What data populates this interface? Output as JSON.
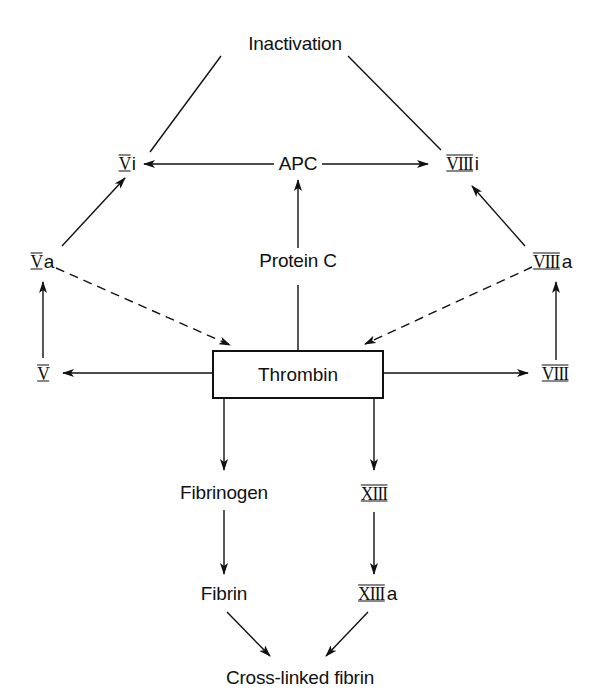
{
  "diagram": {
    "type": "flowchart",
    "nodes": {
      "inactivation": "Inactivation",
      "vi": {
        "numeral": "V",
        "suffix": "i"
      },
      "apc": "APC",
      "viiii": {
        "numeral": "VIII",
        "suffix": "i"
      },
      "va": {
        "numeral": "V",
        "suffix": "a"
      },
      "protein_c": "Protein C",
      "viiia": {
        "numeral": "VIII",
        "suffix": "a"
      },
      "v": {
        "numeral": "V",
        "suffix": ""
      },
      "thrombin": "Thrombin",
      "viii": {
        "numeral": "VIII",
        "suffix": ""
      },
      "fibrinogen": "Fibrinogen",
      "xiii": {
        "numeral": "XIII",
        "suffix": ""
      },
      "fibrin": "Fibrin",
      "xiiia": {
        "numeral": "XIII",
        "suffix": "a"
      },
      "crosslinked": "Cross-linked fibrin"
    },
    "edges": [
      {
        "from": "Vi",
        "to": "Inactivation",
        "style": "line"
      },
      {
        "from": "VIIIi",
        "to": "Inactivation",
        "style": "line"
      },
      {
        "from": "APC",
        "to": "Vi",
        "style": "arrow"
      },
      {
        "from": "APC",
        "to": "VIIIi",
        "style": "arrow"
      },
      {
        "from": "Protein C",
        "to": "APC",
        "style": "arrow"
      },
      {
        "from": "Va",
        "to": "Vi",
        "style": "arrow"
      },
      {
        "from": "VIIIa",
        "to": "VIIIi",
        "style": "arrow"
      },
      {
        "from": "Va",
        "to": "Thrombin",
        "style": "dashed-arrow"
      },
      {
        "from": "VIIIa",
        "to": "Thrombin",
        "style": "dashed-arrow"
      },
      {
        "from": "Thrombin",
        "to": "Protein C",
        "style": "arrow"
      },
      {
        "from": "Thrombin",
        "to": "V",
        "style": "arrow"
      },
      {
        "from": "Thrombin",
        "to": "VIII",
        "style": "arrow"
      },
      {
        "from": "V",
        "to": "Va",
        "style": "arrow"
      },
      {
        "from": "VIII",
        "to": "VIIIa",
        "style": "arrow"
      },
      {
        "from": "Thrombin",
        "to": "Fibrinogen",
        "style": "arrow"
      },
      {
        "from": "Thrombin",
        "to": "XIII",
        "style": "arrow"
      },
      {
        "from": "Fibrinogen",
        "to": "Fibrin",
        "style": "arrow"
      },
      {
        "from": "XIII",
        "to": "XIIIa",
        "style": "arrow"
      },
      {
        "from": "Fibrin",
        "to": "Cross-linked fibrin",
        "style": "arrow"
      },
      {
        "from": "XIIIa",
        "to": "Cross-linked fibrin",
        "style": "arrow"
      }
    ],
    "colors": {
      "ink": "#111111",
      "background": "#ffffff"
    }
  }
}
